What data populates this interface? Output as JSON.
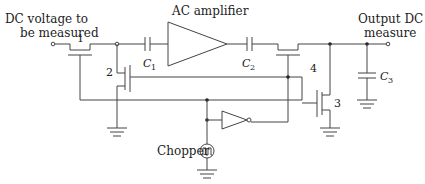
{
  "diagram": {
    "type": "circuit-schematic",
    "labels": {
      "input": [
        "DC voltage to",
        "be measured"
      ],
      "amplifier": "AC amplifier",
      "output": [
        "Output DC",
        "measure"
      ],
      "chopper": "Chopper",
      "c1": "C",
      "c1_sub": "1",
      "c2": "C",
      "c2_sub": "2",
      "c3": "C",
      "c3_sub": "3",
      "t1": "1",
      "t2": "2",
      "t3": "3",
      "t4": "4"
    },
    "components": [
      {
        "id": "T1",
        "kind": "transistor",
        "label": "1"
      },
      {
        "id": "T2",
        "kind": "transistor",
        "label": "2"
      },
      {
        "id": "T3",
        "kind": "transistor",
        "label": "3"
      },
      {
        "id": "T4",
        "kind": "transistor",
        "label": "4"
      },
      {
        "id": "C1",
        "kind": "capacitor"
      },
      {
        "id": "C2",
        "kind": "capacitor"
      },
      {
        "id": "C3",
        "kind": "capacitor"
      },
      {
        "id": "AMP",
        "kind": "amplifier",
        "label": "AC amplifier"
      },
      {
        "id": "INV",
        "kind": "inverter"
      },
      {
        "id": "CHOP",
        "kind": "square-wave-source",
        "label": "Chopper"
      }
    ],
    "colors": {
      "wire": "#444444",
      "text": "#222222",
      "background": "#ffffff"
    }
  }
}
